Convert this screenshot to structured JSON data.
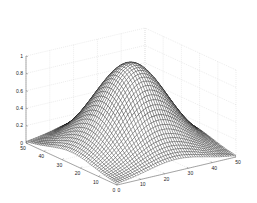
{
  "chart_data": {
    "type": "surface",
    "subtype": "mesh",
    "title": "",
    "xlabel": "",
    "ylabel": "",
    "zlabel": "",
    "x_range": [
      0,
      50
    ],
    "y_range": [
      0,
      50
    ],
    "z_range": [
      0,
      1
    ],
    "x_ticks": [
      "0",
      "10",
      "20",
      "30",
      "40",
      "50"
    ],
    "y_ticks": [
      "0",
      "10",
      "20",
      "30",
      "40",
      "50"
    ],
    "z_ticks": [
      "0",
      "0.2",
      "0.4",
      "0.6",
      "0.8",
      "1"
    ],
    "grid": true,
    "grid_resolution": 50,
    "function": "bell-shaped bump centered at (25,25), peak z=1, falling to ~0.05 at edges",
    "peak": {
      "x": 25,
      "y": 25,
      "z": 1.0
    },
    "edge_value_approx": 0.05,
    "view": {
      "azimuth": -37.5,
      "elevation": 30
    },
    "colors": {
      "mesh_line": "#000000",
      "mesh_face": "#ffffff",
      "grid": "#d0d0d0",
      "axis": "#555555"
    }
  }
}
